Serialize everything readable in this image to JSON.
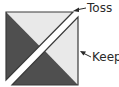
{
  "diagram": {
    "type": "half-square-triangle-cut",
    "labels": {
      "toss": "Toss",
      "keep": "Keep"
    },
    "colors": {
      "light": "#e9e9e9",
      "dark": "#4f4f4f",
      "outline": "#3a3a3a",
      "background": "#ffffff"
    },
    "pieces": [
      {
        "name": "toss-piece",
        "label": "Toss"
      },
      {
        "name": "keep-piece",
        "label": "Keep"
      }
    ]
  }
}
